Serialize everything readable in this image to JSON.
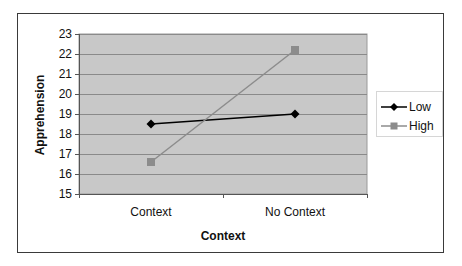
{
  "chart_data": {
    "type": "line",
    "title": "",
    "xlabel": "Context",
    "ylabel": "Apprehension",
    "categories": [
      "Context",
      "No Context"
    ],
    "series": [
      {
        "name": "Low",
        "values": [
          18.5,
          19.0
        ],
        "color": "#000000",
        "marker": "diamond"
      },
      {
        "name": "High",
        "values": [
          16.6,
          22.2
        ],
        "color": "#8c8c8c",
        "marker": "square"
      }
    ],
    "ylim": [
      15,
      23
    ],
    "yticks": [
      "23",
      "22",
      "21",
      "20",
      "19",
      "18",
      "17",
      "16",
      "15"
    ],
    "grid": true,
    "legend_position": "right",
    "plot_background": "#c8c8c8"
  },
  "legend": {
    "items": [
      {
        "label": "Low"
      },
      {
        "label": "High"
      }
    ]
  }
}
